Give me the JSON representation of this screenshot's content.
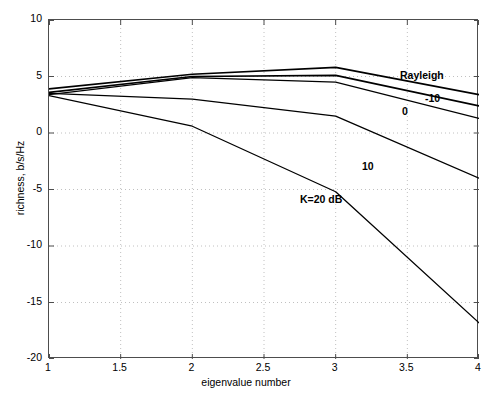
{
  "chart_data": {
    "type": "line",
    "title": "",
    "xlabel": "eigenvalue number",
    "ylabel": "richness, b/s/Hz",
    "xlim": [
      1,
      4
    ],
    "ylim": [
      -20,
      10
    ],
    "xticks": [
      "1",
      "1.5",
      "2",
      "2.5",
      "3",
      "3.5",
      "4"
    ],
    "xtick_values": [
      1,
      1.5,
      2,
      2.5,
      3,
      3.5,
      4
    ],
    "yticks": [
      "10",
      "5",
      "0",
      "-5",
      "-10",
      "-15",
      "-20"
    ],
    "ytick_values": [
      10,
      5,
      0,
      -5,
      -10,
      -15,
      -20
    ],
    "grid": true,
    "grid_style": "dotted",
    "legend": "inline annotations",
    "x": [
      1,
      2,
      3,
      4
    ],
    "series": [
      {
        "name": "Rayleigh",
        "label": "Rayleigh",
        "values": [
          3.9,
          5.2,
          5.8,
          3.4
        ],
        "color": "#000000",
        "width": 1.7
      },
      {
        "name": "K=-10 dB",
        "label": "-10",
        "values": [
          3.6,
          5.0,
          5.1,
          2.4
        ],
        "color": "#000000",
        "width": 1.7
      },
      {
        "name": "K=0 dB",
        "label": "0",
        "values": [
          3.4,
          4.9,
          4.5,
          1.3
        ],
        "color": "#000000",
        "width": 1.3
      },
      {
        "name": "K=10 dB",
        "label": "10",
        "values": [
          3.5,
          3.0,
          1.5,
          -4.0
        ],
        "color": "#000000",
        "width": 1.3
      },
      {
        "name": "K=20 dB",
        "label": "K=20 dB",
        "values": [
          3.3,
          0.6,
          -5.2,
          -16.8
        ],
        "color": "#000000",
        "width": 1.3
      }
    ],
    "annotations": [
      {
        "text": "Rayleigh",
        "x_px": 399,
        "y_px": 69,
        "bold": true
      },
      {
        "text": "-10",
        "x_px": 424,
        "y_px": 92,
        "bold": true
      },
      {
        "text": "0",
        "x_px": 401,
        "y_px": 105,
        "bold": true
      },
      {
        "text": "10",
        "x_px": 361,
        "y_px": 160,
        "bold": true
      },
      {
        "text": "K=20 dB",
        "x_px": 299,
        "y_px": 193,
        "bold": true
      }
    ]
  }
}
